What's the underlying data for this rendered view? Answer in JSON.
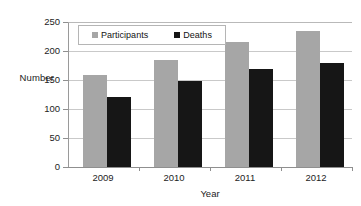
{
  "chart_data": {
    "type": "bar",
    "title": "",
    "xlabel": "Year",
    "ylabel": "Number",
    "categories": [
      "2009",
      "2010",
      "2011",
      "2012"
    ],
    "series": [
      {
        "name": "Participants",
        "color": "#a6a6a6",
        "values": [
          160,
          185,
          217,
          236
        ]
      },
      {
        "name": "Deaths",
        "color": "#161616",
        "values": [
          122,
          150,
          171,
          181
        ]
      }
    ],
    "ylim": [
      0,
      250
    ],
    "yticks": [
      0,
      50,
      100,
      150,
      200,
      250
    ],
    "ytick_labels": [
      "0",
      "50",
      "100",
      "150",
      "200",
      "250"
    ],
    "grid": "horizontal",
    "legend_position": "top-left-inside"
  },
  "legend": {
    "entries": [
      {
        "label": "Participants",
        "swatch": "square-gray-icon"
      },
      {
        "label": "Deaths",
        "swatch": "square-black-icon"
      }
    ]
  },
  "axes": {
    "y_title": "Number",
    "x_title": "Year",
    "y_labels": [
      "250",
      "200",
      "150",
      "100",
      "50",
      "0"
    ],
    "x_labels": [
      "2009",
      "2010",
      "2011",
      "2012"
    ]
  }
}
